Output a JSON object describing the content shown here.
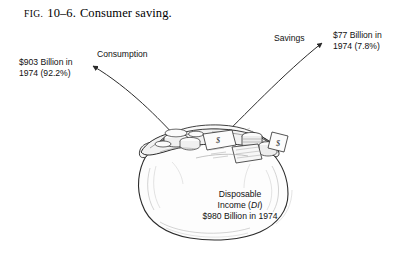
{
  "figure": {
    "label_prefix": "FIG.",
    "number": "10–6.",
    "title": "Consumer saving."
  },
  "callouts": {
    "consumption": {
      "name": "Consumption",
      "value_line1": "$903 Billion in",
      "value_line2": "1974 (92.2%)"
    },
    "savings": {
      "name": "Savings",
      "value_line1": "$77 Billion in",
      "value_line2": "1974 (7.8%)"
    },
    "disposable_income": {
      "line1": "Disposable",
      "line2_prefix": "Income (",
      "line2_italic": "DI",
      "line2_suffix": ")",
      "line3": "$980 Billion in 1974"
    }
  },
  "illustration": {
    "subject": "money-bag",
    "contents": "coins and dollar bills",
    "ink_color": "#2b2b2b",
    "background_color": "#ffffff"
  }
}
